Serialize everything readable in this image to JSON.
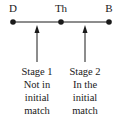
{
  "diagram": {
    "nodes": [
      {
        "label": "D",
        "x": 13
      },
      {
        "label": "Th",
        "x": 61
      },
      {
        "label": "B",
        "x": 109
      }
    ],
    "line": {
      "y": 22,
      "x1": 13,
      "x2": 109
    },
    "arrows": [
      {
        "x": 37,
        "caption": [
          "Stage 1",
          "Not in",
          "initial",
          "match"
        ]
      },
      {
        "x": 85,
        "caption": [
          "Stage 2",
          "In the",
          "initial",
          "match"
        ]
      }
    ],
    "colors": {
      "ink": "#1a1a1a",
      "background": "#ffffff"
    }
  }
}
